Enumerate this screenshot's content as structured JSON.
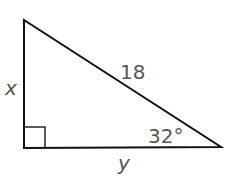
{
  "diagram": {
    "type": "right-triangle",
    "labels": {
      "vertical_leg": "x",
      "hypotenuse": "18",
      "angle": "32°",
      "horizontal_leg": "y"
    },
    "right_angle_marker": true,
    "colors": {
      "stroke": "#111111",
      "label": "#555555",
      "background": "#ffffff"
    }
  }
}
